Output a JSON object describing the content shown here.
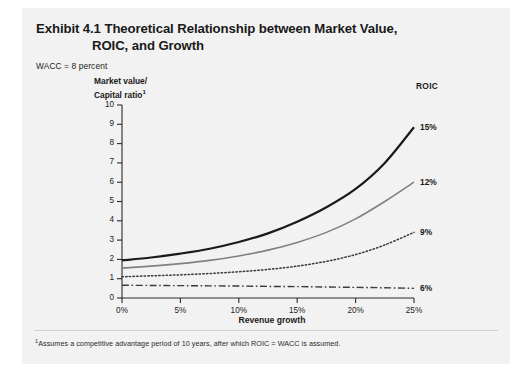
{
  "exhibit": {
    "title_line1": "Exhibit 4.1 Theoretical Relationship between Market Value,",
    "title_line2": "ROIC, and Growth",
    "wacc_note": "WACC = 8 percent",
    "footnote_marker": "1",
    "footnote_text": "Assumes a competitive advantage period of 10 years, after which ROIC = WACC is assumed.",
    "legend_header": "ROIC",
    "panel_bg": "#f2f2f2"
  },
  "chart_data": {
    "type": "line",
    "title": "Exhibit 4.1 Theoretical Relationship between Market Value, ROIC, and Growth",
    "subtitle": "WACC = 8 percent",
    "xlabel": "Revenue growth",
    "ylabel": "Market value/\nCapital ratio",
    "ylabel_line1": "Market value/",
    "ylabel_line2": "Capital ratio",
    "ylabel_footnote_marker": "1",
    "xlim": [
      0,
      25
    ],
    "ylim": [
      0,
      10
    ],
    "xticks": [
      0,
      5,
      10,
      15,
      20,
      25
    ],
    "xtick_labels": [
      "0%",
      "5%",
      "10%",
      "15%",
      "20%",
      "25%"
    ],
    "yticks": [
      0,
      1,
      2,
      3,
      4,
      5,
      6,
      7,
      8,
      9,
      10
    ],
    "ytick_labels": [
      "0",
      "1",
      "2",
      "3",
      "4",
      "5",
      "6",
      "7",
      "8",
      "9",
      "10"
    ],
    "grid": false,
    "legend_position": "right-inline",
    "legend_title": "ROIC",
    "x": [
      0,
      2.5,
      5,
      7.5,
      10,
      12.5,
      15,
      17.5,
      20,
      22.5,
      25
    ],
    "series": [
      {
        "name": "15%",
        "label": "15%",
        "roic_percent": 15,
        "style": "solid",
        "color": "#1a1a1a",
        "width": 2.2,
        "values": [
          1.95,
          2.1,
          2.3,
          2.55,
          2.9,
          3.35,
          3.95,
          4.7,
          5.65,
          7.0,
          8.85
        ]
      },
      {
        "name": "12%",
        "label": "12%",
        "roic_percent": 12,
        "style": "solid",
        "color": "#808080",
        "width": 1.6,
        "values": [
          1.55,
          1.65,
          1.78,
          1.95,
          2.18,
          2.48,
          2.88,
          3.4,
          4.1,
          5.0,
          6.0
        ]
      },
      {
        "name": "9%",
        "label": "9%",
        "roic_percent": 9,
        "style": "dotted",
        "color": "#3a3a3a",
        "width": 1.5,
        "values": [
          1.1,
          1.15,
          1.2,
          1.27,
          1.36,
          1.48,
          1.65,
          1.9,
          2.25,
          2.75,
          3.4
        ]
      },
      {
        "name": "6%",
        "label": "6%",
        "roic_percent": 6,
        "style": "dashdot",
        "color": "#3a3a3a",
        "width": 1.4,
        "values": [
          0.66,
          0.65,
          0.64,
          0.63,
          0.62,
          0.6,
          0.59,
          0.57,
          0.55,
          0.53,
          0.5
        ]
      }
    ]
  }
}
